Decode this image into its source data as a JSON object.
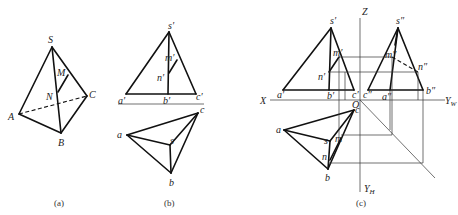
{
  "figures": [
    {
      "id": "a",
      "caption": "(a)",
      "description": "Triangular pyramid S-ABC with line MN on face SBC (pictorial view)",
      "labels": {
        "S": "S",
        "M": "M",
        "N": "N",
        "A": "A",
        "B": "B",
        "C": "C"
      }
    },
    {
      "id": "b",
      "caption": "(b)",
      "description": "Two-view projection (front and top) of pyramid with line mn",
      "labels": {
        "s1": "s′",
        "m1": "m′",
        "n1": "n′",
        "a1": "a′",
        "b1": "b′",
        "c1": "c′",
        "a": "a",
        "b": "b",
        "c": "c",
        "s": "s"
      }
    },
    {
      "id": "c",
      "caption": "(c)",
      "description": "Three-view projection with axes X, Z, Y_W, Y_H and origin O",
      "labels": {
        "s1": "s′",
        "m1": "m′",
        "n1": "n′",
        "a1": "a′",
        "b1": "b′",
        "c1": "c′",
        "s2": "s″",
        "m2": "m″",
        "n2": "n″",
        "a2": "a″",
        "b2": "b″",
        "c2": "c″",
        "a": "a",
        "b": "b",
        "c": "c",
        "s": "s",
        "m": "m",
        "n": "n",
        "X": "X",
        "Z": "Z",
        "O": "O",
        "YW": "Y",
        "YW_sub": "W",
        "YH": "Y",
        "YH_sub": "H"
      }
    }
  ]
}
